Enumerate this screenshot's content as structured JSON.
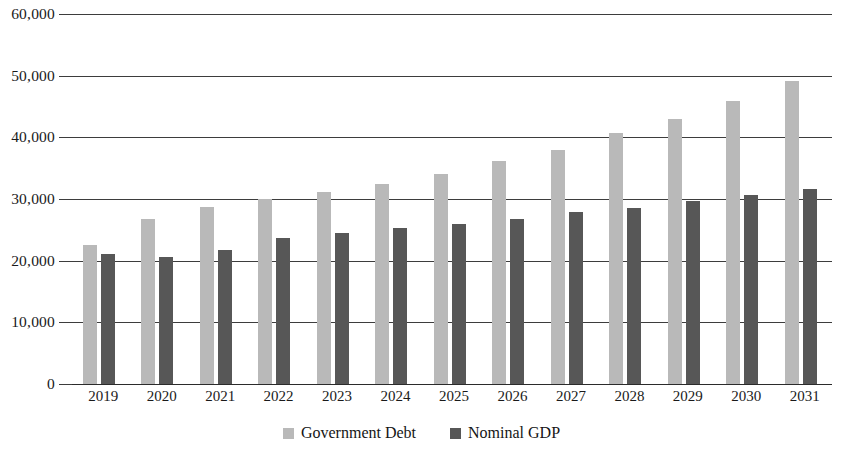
{
  "chart_data": {
    "type": "bar",
    "title": "",
    "subtitle": "",
    "xlabel": "",
    "ylabel": "",
    "ylim": [
      0,
      60000
    ],
    "yticks": [
      0,
      10000,
      20000,
      30000,
      40000,
      50000,
      60000
    ],
    "ytick_labels": [
      "0",
      "10,000",
      "20,000",
      "30,000",
      "40,000",
      "50,000",
      "60,000"
    ],
    "grid": true,
    "legend_position": "bottom",
    "categories": [
      "2019",
      "2020",
      "2021",
      "2022",
      "2023",
      "2024",
      "2025",
      "2026",
      "2027",
      "2028",
      "2029",
      "2030",
      "2031"
    ],
    "series": [
      {
        "name": "Government Debt",
        "color": "#b9b9b9",
        "values": [
          22500,
          26700,
          28700,
          30000,
          31100,
          32400,
          34100,
          36100,
          38000,
          40700,
          42900,
          45900,
          49100
        ]
      },
      {
        "name": "Nominal GDP",
        "color": "#575757",
        "values": [
          21100,
          20600,
          21800,
          23600,
          24500,
          25300,
          26000,
          26800,
          27900,
          28600,
          29600,
          30600,
          31700
        ]
      }
    ]
  },
  "axis": {
    "gridline_color": "#3d3d3d",
    "baseline_color": "#2b2b2b"
  }
}
